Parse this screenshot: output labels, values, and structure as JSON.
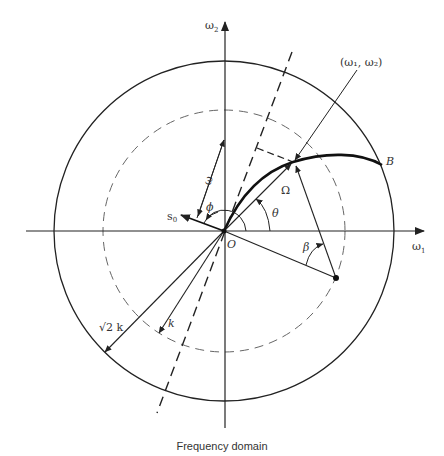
{
  "caption": "Frequency domain",
  "axes": {
    "x_label": "ω",
    "x_label_sub": "1",
    "y_label": "ω",
    "y_label_sub": "2",
    "origin_label": "O"
  },
  "points": {
    "omega_point_label": "(ω₁, ω₂)",
    "b_label": "B"
  },
  "labels": {
    "omega": "ω",
    "phi": "ϕ",
    "theta": "θ",
    "beta": "β",
    "capital_omega": "Ω",
    "s0": "s",
    "s0_sub": "0",
    "k": "k",
    "sqrt2k": "√2 k"
  },
  "circles": {
    "outer_radius_label": "√2 k",
    "inner_radius_label": "k",
    "outer_style": "solid",
    "inner_style": "dashed"
  },
  "colors": {
    "line": "#222222",
    "dashed": "#555555",
    "text": "#333333",
    "background": "#ffffff"
  }
}
